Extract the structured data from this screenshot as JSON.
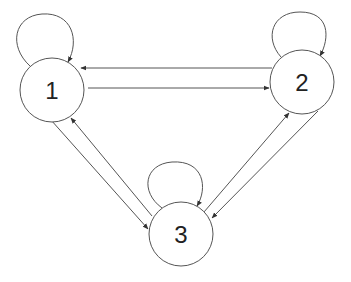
{
  "diagram": {
    "type": "directed-graph",
    "nodes": [
      {
        "id": "1",
        "label": "1",
        "cx": 52,
        "cy": 90,
        "r": 32
      },
      {
        "id": "2",
        "label": "2",
        "cx": 302,
        "cy": 82,
        "r": 32
      },
      {
        "id": "3",
        "label": "3",
        "cx": 181,
        "cy": 234,
        "r": 32
      }
    ],
    "edges": [
      {
        "from": "1",
        "to": "1",
        "kind": "self-loop"
      },
      {
        "from": "2",
        "to": "2",
        "kind": "self-loop"
      },
      {
        "from": "3",
        "to": "3",
        "kind": "self-loop"
      },
      {
        "from": "1",
        "to": "2"
      },
      {
        "from": "2",
        "to": "1"
      },
      {
        "from": "1",
        "to": "3"
      },
      {
        "from": "3",
        "to": "1"
      },
      {
        "from": "2",
        "to": "3"
      },
      {
        "from": "3",
        "to": "2"
      }
    ],
    "colors": {
      "stroke": "#555555",
      "text": "#222222",
      "background": "#ffffff"
    }
  }
}
